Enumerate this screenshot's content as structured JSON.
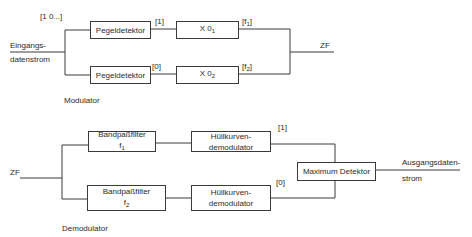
{
  "modulator": {
    "title": "Modulator",
    "input_label_line1": "Eingangs-",
    "input_label_line2": "datenstrom",
    "input_sequence": "[1 0...]",
    "upper_branch": {
      "detector": "Pegeldetektor",
      "bit": "[1]",
      "multiplier": "X 0",
      "multiplier_sub": "1",
      "freq_prefix": "[f",
      "freq_sub": "1",
      "freq_suffix": "]"
    },
    "lower_branch": {
      "detector": "Pegeldetektor",
      "bit": "[0]",
      "multiplier": "X 0",
      "multiplier_sub": "2",
      "freq_prefix": "[f",
      "freq_sub": "2",
      "freq_suffix": "]"
    },
    "output_label": "ZF"
  },
  "demodulator": {
    "title": "Demodulator",
    "input_label": "ZF",
    "upper_branch": {
      "filter_line1": "Bandpaßfilter",
      "filter_line2": "f",
      "filter_sub": "1",
      "envelope_line1": "Hüllkurven-",
      "envelope_line2": "demodulator",
      "bit": "[1]"
    },
    "lower_branch": {
      "filter_line1": "Bandpaßfilter",
      "filter_line2": "f",
      "filter_sub": "2",
      "envelope_line1": "Hüllkurven-",
      "envelope_line2": "demodulator",
      "bit": "[0]"
    },
    "detector": "Maximum Detektor",
    "output_label_line1": "Ausgangsdaten-",
    "output_label_line2": "strom"
  },
  "colors": {
    "line": "#3a3a3a",
    "background": "#ffffff"
  }
}
